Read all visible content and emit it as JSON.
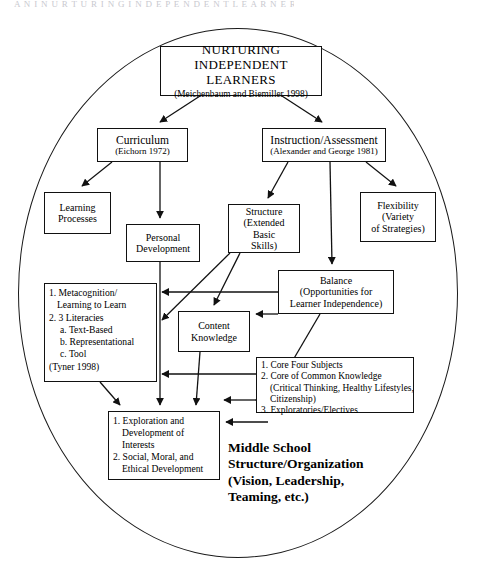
{
  "page": {
    "running_head": "A N I     N U R T U R I N G   I N D E P E N D E N T   L E A R N E R S",
    "width": 478,
    "height": 566,
    "background": "#ffffff",
    "stroke_color": "#111111"
  },
  "diagram": {
    "type": "flow-diagram",
    "container_shape": "ellipse",
    "nodes": {
      "root": {
        "title": "NURTURING",
        "title2": "INDEPENDENT LEARNERS",
        "citation": "(Meichenbaum and Biemiller 1998)"
      },
      "curriculum": {
        "title": "Curriculum",
        "citation": "(Eichorn 1972)"
      },
      "instruction": {
        "title": "Instruction/Assessment",
        "citation": "(Alexander and George 1981)"
      },
      "learning_processes": {
        "line1": "Learning",
        "line2": "Processes"
      },
      "personal_development": {
        "line1": "Personal",
        "line2": "Development"
      },
      "structure": {
        "line1": "Structure",
        "line2": "(Extended Basic",
        "line3": "Skills)"
      },
      "flexibility": {
        "line1": "Flexibility",
        "line2": "(Variety",
        "line3": "of Strategies)"
      },
      "balance": {
        "line1": "Balance",
        "line2": "(Opportunities for",
        "line3": "Learner Independence)"
      },
      "metacognition": {
        "line1": "1. Metacognition/",
        "line2": "Learning to Learn",
        "line3": "2. 3 Literacies",
        "line4": "a. Text-Based",
        "line5": "b. Representational",
        "line6": "c. Tool",
        "line7": "(Tyner 1998)"
      },
      "content_knowledge": {
        "line1": "Content",
        "line2": "Knowledge"
      },
      "core_four": {
        "line1": "1. Core Four Subjects",
        "line2": "2. Core of Common Knowledge",
        "line3": "(Critical Thinking, Healthy Lifestyles,",
        "line4": "Citizenship)",
        "line5": "3. Exploratories/Electives"
      },
      "exploration": {
        "line1": "1. Exploration and",
        "line2": "Development of",
        "line3": "Interests",
        "line4": "2. Social, Moral, and",
        "line5": "Ethical Development"
      }
    },
    "free_text": {
      "middle_school": {
        "line1": "Middle School",
        "line2": "Structure/Organization",
        "line3": "(Vision, Leadership,",
        "line4": "Teaming, etc.)"
      }
    }
  }
}
